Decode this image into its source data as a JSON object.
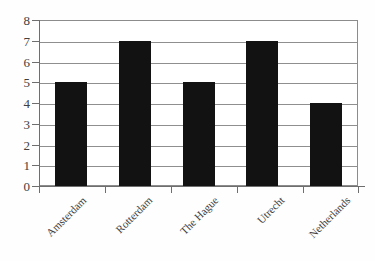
{
  "chart_data": {
    "type": "bar",
    "title": "",
    "subtitle": "",
    "xlabel": "",
    "ylabel": "",
    "categories": [
      "Amsterdam",
      "Rotterdam",
      "The Hague",
      "Utrecht",
      "Netherlands"
    ],
    "values": [
      5,
      7,
      5,
      7,
      4
    ],
    "ylim": [
      0,
      8
    ],
    "ytick_labels": [
      "8",
      "7",
      "6",
      "5",
      "4",
      "3",
      "2",
      "1",
      "0"
    ],
    "ytick_values": [
      8,
      7,
      6,
      5,
      4,
      3,
      2,
      1,
      0
    ],
    "grid": true,
    "grid_axis": "y",
    "legend": false,
    "legend_position": "none",
    "bar_color": "#121212",
    "grid_color": "#8f8f8f",
    "axis_color": "#6e6e6e",
    "background_color": "#ffffff"
  }
}
